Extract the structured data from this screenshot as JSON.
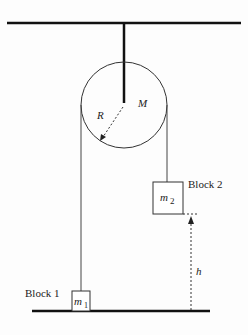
{
  "diagram": {
    "type": "pulley system",
    "pulley": {
      "mass_label": "M",
      "radius_label": "R"
    },
    "block1": {
      "name": "Block 1",
      "mass_label": "m",
      "mass_sub": "1"
    },
    "block2": {
      "name": "Block 2",
      "mass_label": "m",
      "mass_sub": "2"
    },
    "height_label": "h",
    "colors": {
      "line": "#111111",
      "background": "#fdfdfd"
    }
  }
}
